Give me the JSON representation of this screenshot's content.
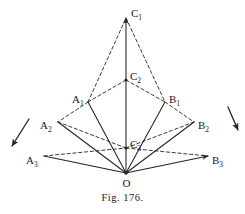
{
  "figure": {
    "caption": "Fig. 176.",
    "stroke_color": "#222222",
    "background_color": "#ffffff",
    "vertex_apex": {
      "id": "O",
      "label": "O",
      "x": 126,
      "y": 173
    },
    "points": [
      {
        "id": "C1",
        "label": "C",
        "sub": "1",
        "x": 126,
        "y": 18,
        "label_x": 131,
        "label_y": 12
      },
      {
        "id": "C2",
        "label": "C",
        "sub": "2",
        "x": 126,
        "y": 80,
        "label_x": 130,
        "label_y": 75
      },
      {
        "id": "C3",
        "label": "C",
        "sub": "3",
        "x": 126,
        "y": 148,
        "label_x": 130,
        "label_y": 143
      },
      {
        "id": "A1",
        "label": "A",
        "sub": "1",
        "x": 88,
        "y": 102,
        "label_x": 72,
        "label_y": 98
      },
      {
        "id": "A2",
        "label": "A",
        "sub": "2",
        "x": 58,
        "y": 122,
        "label_x": 40,
        "label_y": 124
      },
      {
        "id": "A3",
        "label": "A",
        "sub": "3",
        "x": 44,
        "y": 156,
        "label_x": 26,
        "label_y": 159
      },
      {
        "id": "B1",
        "label": "B",
        "sub": "1",
        "x": 165,
        "y": 102,
        "label_x": 169,
        "label_y": 98
      },
      {
        "id": "B2",
        "label": "B",
        "sub": "2",
        "x": 194,
        "y": 122,
        "label_x": 198,
        "label_y": 124
      },
      {
        "id": "B3",
        "label": "B",
        "sub": "3",
        "x": 208,
        "y": 156,
        "label_x": 212,
        "label_y": 159
      }
    ],
    "solid_rays": [
      {
        "name": "ray-O-C1",
        "from": "O",
        "to": "C1",
        "arrow": true
      },
      {
        "name": "ray-O-A1",
        "from": "O",
        "to": "A1",
        "arrow": false
      },
      {
        "name": "ray-O-A2",
        "from": "O",
        "to": "A2",
        "arrow": false
      },
      {
        "name": "ray-O-A3",
        "from": "O",
        "to": "A3",
        "arrow": false
      },
      {
        "name": "ray-O-B1",
        "from": "O",
        "to": "B1",
        "arrow": false
      },
      {
        "name": "ray-O-B2",
        "from": "O",
        "to": "B2",
        "arrow": false
      },
      {
        "name": "ray-O-B3",
        "from": "O",
        "to": "B3",
        "arrow": true
      }
    ],
    "dashed_edges": [
      {
        "name": "edge-A1-C1",
        "from": "A1",
        "to": "C1"
      },
      {
        "name": "edge-C1-B1",
        "from": "C1",
        "to": "B1"
      },
      {
        "name": "edge-A1-C2",
        "from": "A1",
        "to": "C2"
      },
      {
        "name": "edge-C2-B1",
        "from": "C2",
        "to": "B1"
      },
      {
        "name": "edge-A1-A2",
        "from": "A1",
        "to": "A2"
      },
      {
        "name": "edge-B1-B2",
        "from": "B1",
        "to": "B2"
      },
      {
        "name": "edge-A2-C3",
        "from": "A2",
        "to": "C3"
      },
      {
        "name": "edge-C3-B2",
        "from": "C3",
        "to": "B2"
      },
      {
        "name": "edge-A3-C3",
        "from": "A3",
        "to": "C3"
      },
      {
        "name": "edge-C3-B3",
        "from": "C3",
        "to": "B3"
      }
    ],
    "motion_arrows": [
      {
        "name": "motion-arrow-left",
        "x1": 29,
        "y1": 119,
        "x2": 12,
        "y2": 146
      },
      {
        "name": "motion-arrow-right",
        "x1": 228,
        "y1": 107,
        "x2": 238,
        "y2": 130
      }
    ]
  }
}
